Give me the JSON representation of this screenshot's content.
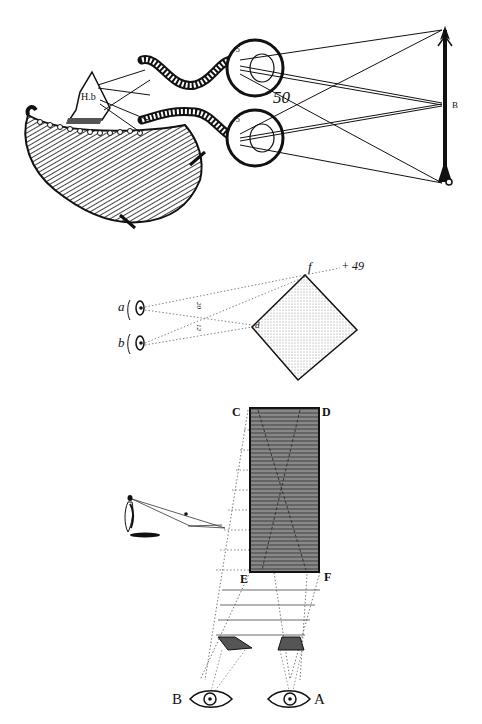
{
  "figures": [
    {
      "id": "binocular-vision",
      "description": "Two eyes with optic nerves to brain viewing an arrow",
      "labels": {
        "figure_number": "50",
        "arrow_top": "A",
        "arrow_mid": "B",
        "head_label": "H.b",
        "eye_upper_marks": [
          "5",
          "3",
          "1"
        ],
        "eye_lower_marks": [
          "5",
          "3",
          "1"
        ]
      }
    },
    {
      "id": "square-distance",
      "description": "Two eyes a and b viewing a tilted square",
      "labels": {
        "eye_a": "a",
        "eye_b": "b",
        "corner_f": "f",
        "corner_d": "d",
        "figure_number": "49",
        "figure_plus": "+",
        "line_mark_1": "20",
        "line_mark_2": "12"
      }
    },
    {
      "id": "rectangle-projection",
      "description": "Rectangle CDEF projected to eyes A and B with figure casting shadow",
      "labels": {
        "corner_c": "C",
        "corner_d": "D",
        "corner_e": "E",
        "corner_f": "F",
        "eye_a": "A",
        "eye_b": "B"
      }
    }
  ],
  "colors": {
    "ink": "#111111",
    "paper": "#ffffff",
    "shade": "#777777"
  }
}
